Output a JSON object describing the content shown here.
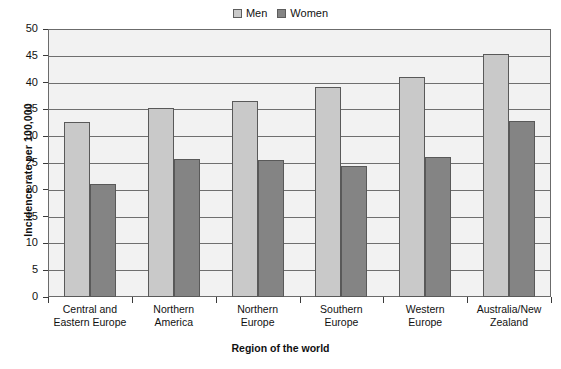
{
  "chart_data": {
    "type": "bar",
    "title": "",
    "xlabel": "Region of the world",
    "ylabel": "Incidence rate per 100,000",
    "categories": [
      "Central and Eastern Europe",
      "Northern America",
      "Northern Europe",
      "Southern Europe",
      "Western Europe",
      "Australia/New Zealand"
    ],
    "category_lines": [
      [
        "Central and",
        "Eastern Europe"
      ],
      [
        "Northern",
        "America"
      ],
      [
        "Northern",
        "Europe"
      ],
      [
        "Southern",
        "Europe"
      ],
      [
        "Western",
        "Europe"
      ],
      [
        "Australia/New",
        "Zealand"
      ]
    ],
    "series": [
      {
        "name": "Men",
        "color": "#c9c9c9",
        "values": [
          32.7,
          35.3,
          36.6,
          39.2,
          41.0,
          45.4
        ]
      },
      {
        "name": "Women",
        "color": "#848484",
        "values": [
          21.0,
          25.7,
          25.6,
          24.4,
          26.2,
          32.8
        ]
      }
    ],
    "ylim": [
      0,
      50
    ],
    "yticks": [
      0,
      5,
      10,
      15,
      20,
      25,
      30,
      35,
      40,
      45,
      50
    ],
    "ytick_labels": [
      "0",
      "5",
      "10",
      "15",
      "20",
      "25",
      "30",
      "35",
      "40",
      "45",
      "50"
    ],
    "grid": true,
    "legend_position": "top-center",
    "plot_background": "#f2f2f2",
    "axis_color": "#6b6b6b"
  },
  "legend": {
    "entries": [
      {
        "label": "Men"
      },
      {
        "label": "Women"
      }
    ]
  }
}
